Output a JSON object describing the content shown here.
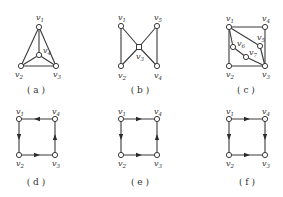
{
  "figure": {
    "graphs": [
      {
        "id": "a",
        "caption": "( a )",
        "directed": false,
        "nodes": [
          {
            "id": "v1",
            "label": "v",
            "sub": "1",
            "x": 39,
            "y": 27,
            "lx": 36,
            "ly": 20
          },
          {
            "id": "v2",
            "label": "v",
            "sub": "2",
            "x": 21,
            "y": 66,
            "lx": 15,
            "ly": 77
          },
          {
            "id": "v3",
            "label": "v",
            "sub": "3",
            "x": 56,
            "y": 66,
            "lx": 53,
            "ly": 77
          },
          {
            "id": "v4",
            "label": "v",
            "sub": "4",
            "x": 39,
            "y": 55,
            "lx": 43,
            "ly": 53
          }
        ],
        "edges": [
          [
            "v1",
            "v2"
          ],
          [
            "v1",
            "v3"
          ],
          [
            "v2",
            "v3"
          ],
          [
            "v1",
            "v4"
          ],
          [
            "v2",
            "v4"
          ],
          [
            "v3",
            "v4"
          ]
        ],
        "caption_pos": {
          "x": 36,
          "y": 93
        }
      },
      {
        "id": "b",
        "caption": "( b )",
        "directed": false,
        "nodes": [
          {
            "id": "v1",
            "label": "v",
            "sub": "1",
            "x": 121,
            "y": 26,
            "lx": 118,
            "ly": 20
          },
          {
            "id": "v5",
            "label": "v",
            "sub": "5",
            "x": 157,
            "y": 26,
            "lx": 154,
            "ly": 20
          },
          {
            "id": "v3",
            "label": "v",
            "sub": "3",
            "x": 139,
            "y": 47,
            "lx": 136,
            "ly": 59,
            "shape": "square"
          },
          {
            "id": "v2",
            "label": "v",
            "sub": "2",
            "x": 121,
            "y": 66,
            "lx": 118,
            "ly": 78
          },
          {
            "id": "v4",
            "label": "v",
            "sub": "4",
            "x": 157,
            "y": 66,
            "lx": 154,
            "ly": 78
          }
        ],
        "edges": [
          [
            "v1",
            "v2"
          ],
          [
            "v1",
            "v3"
          ],
          [
            "v2",
            "v3"
          ],
          [
            "v5",
            "v3"
          ],
          [
            "v4",
            "v3"
          ],
          [
            "v5",
            "v4"
          ]
        ],
        "caption_pos": {
          "x": 140,
          "y": 93
        }
      },
      {
        "id": "c",
        "caption": "( c )",
        "directed": false,
        "nodes": [
          {
            "id": "v1",
            "label": "v",
            "sub": "1",
            "x": 229,
            "y": 27,
            "lx": 226,
            "ly": 21
          },
          {
            "id": "v4",
            "label": "v",
            "sub": "4",
            "x": 265,
            "y": 27,
            "lx": 262,
            "ly": 21
          },
          {
            "id": "v5",
            "label": "v",
            "sub": "5",
            "x": 260,
            "y": 46,
            "lx": 257,
            "ly": 40
          },
          {
            "id": "v6",
            "label": "v",
            "sub": "6",
            "x": 233,
            "y": 47,
            "lx": 237,
            "ly": 46
          },
          {
            "id": "v7",
            "label": "v",
            "sub": "7",
            "x": 246,
            "y": 57,
            "lx": 249,
            "ly": 55
          },
          {
            "id": "v2",
            "label": "v",
            "sub": "2",
            "x": 229,
            "y": 66,
            "lx": 226,
            "ly": 77
          },
          {
            "id": "v3",
            "label": "v",
            "sub": "3",
            "x": 265,
            "y": 66,
            "lx": 262,
            "ly": 77
          }
        ],
        "edges": [
          [
            "v1",
            "v4"
          ],
          [
            "v4",
            "v3"
          ],
          [
            "v1",
            "v2"
          ],
          [
            "v2",
            "v3"
          ],
          [
            "v1",
            "v5"
          ],
          [
            "v5",
            "v3"
          ],
          [
            "v1",
            "v6"
          ],
          [
            "v6",
            "v7"
          ],
          [
            "v7",
            "v3"
          ]
        ],
        "caption_pos": {
          "x": 246,
          "y": 93
        }
      },
      {
        "id": "d",
        "caption": "( d )",
        "directed": true,
        "nodes": [
          {
            "id": "v1",
            "label": "v",
            "sub": "1",
            "x": 19,
            "y": 119,
            "lx": 16,
            "ly": 114
          },
          {
            "id": "v4",
            "label": "v",
            "sub": "4",
            "x": 55,
            "y": 119,
            "lx": 52,
            "ly": 114
          },
          {
            "id": "v2",
            "label": "v",
            "sub": "2",
            "x": 19,
            "y": 155,
            "lx": 16,
            "ly": 166
          },
          {
            "id": "v3",
            "label": "v",
            "sub": "3",
            "x": 55,
            "y": 155,
            "lx": 52,
            "ly": 166
          }
        ],
        "edges": [
          [
            "v4",
            "v1"
          ],
          [
            "v1",
            "v2"
          ],
          [
            "v2",
            "v3"
          ],
          [
            "v3",
            "v4"
          ]
        ],
        "caption_pos": {
          "x": 36,
          "y": 185
        }
      },
      {
        "id": "e",
        "caption": "( e )",
        "directed": true,
        "nodes": [
          {
            "id": "v1",
            "label": "v",
            "sub": "1",
            "x": 121,
            "y": 119,
            "lx": 118,
            "ly": 114
          },
          {
            "id": "v4",
            "label": "v",
            "sub": "4",
            "x": 157,
            "y": 119,
            "lx": 154,
            "ly": 114
          },
          {
            "id": "v2",
            "label": "v",
            "sub": "2",
            "x": 121,
            "y": 155,
            "lx": 118,
            "ly": 166
          },
          {
            "id": "v3",
            "label": "v",
            "sub": "3",
            "x": 157,
            "y": 155,
            "lx": 154,
            "ly": 166
          }
        ],
        "edges": [
          [
            "v1",
            "v4"
          ],
          [
            "v1",
            "v2"
          ],
          [
            "v2",
            "v3"
          ],
          [
            "v3",
            "v4"
          ]
        ],
        "caption_pos": {
          "x": 140,
          "y": 185
        }
      },
      {
        "id": "f",
        "caption": "( f )",
        "directed": true,
        "nodes": [
          {
            "id": "v1",
            "label": "v",
            "sub": "1",
            "x": 229,
            "y": 119,
            "lx": 226,
            "ly": 114
          },
          {
            "id": "v4",
            "label": "v",
            "sub": "4",
            "x": 265,
            "y": 119,
            "lx": 262,
            "ly": 114
          },
          {
            "id": "v2",
            "label": "v",
            "sub": "2",
            "x": 229,
            "y": 155,
            "lx": 226,
            "ly": 166
          },
          {
            "id": "v3",
            "label": "v",
            "sub": "3",
            "x": 265,
            "y": 155,
            "lx": 262,
            "ly": 166
          }
        ],
        "edges": [
          [
            "v1",
            "v4"
          ],
          [
            "v1",
            "v2"
          ],
          [
            "v2",
            "v3"
          ],
          [
            "v4",
            "v3"
          ]
        ],
        "caption_pos": {
          "x": 247,
          "y": 185
        }
      }
    ]
  }
}
